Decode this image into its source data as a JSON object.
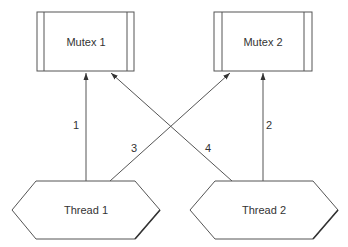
{
  "diagram": {
    "title": "",
    "mutexes": [
      {
        "id": "mutex1",
        "label": "Mutex 1"
      },
      {
        "id": "mutex2",
        "label": "Mutex 2"
      }
    ],
    "threads": [
      {
        "id": "thread1",
        "label": "Thread 1"
      },
      {
        "id": "thread2",
        "label": "Thread 2"
      }
    ],
    "edges": [
      {
        "from": "thread1",
        "to": "mutex1",
        "label": "1"
      },
      {
        "from": "thread2",
        "to": "mutex2",
        "label": "2"
      },
      {
        "from": "thread1",
        "to": "mutex2",
        "label": "3"
      },
      {
        "from": "thread2",
        "to": "mutex1",
        "label": "4"
      }
    ],
    "colors": {
      "stroke": "#555555",
      "text": "#333333",
      "background": "#ffffff"
    }
  }
}
